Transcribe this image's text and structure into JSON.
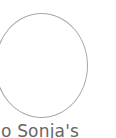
{
  "tile": {
    "avatar": {
      "icon": "empty-circle-placeholder",
      "stroke_color": "#a8a8a8",
      "fill_color": "#ffffff"
    },
    "caption": "lo Sonja's",
    "caption_color": "#666666"
  }
}
